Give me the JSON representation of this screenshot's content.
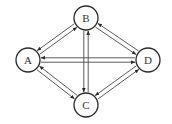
{
  "diagram": {
    "type": "directed-graph",
    "colors": {
      "background": "#ffffff",
      "stroke": "#2a2a2a",
      "edge": "#4a4a4a",
      "text": "#333333"
    },
    "nodes": [
      {
        "id": "A",
        "label": "A",
        "x": 28,
        "y": 60,
        "r": 12
      },
      {
        "id": "B",
        "label": "B",
        "x": 86,
        "y": 18,
        "r": 12
      },
      {
        "id": "C",
        "label": "C",
        "x": 86,
        "y": 105,
        "r": 12
      },
      {
        "id": "D",
        "label": "D",
        "x": 148,
        "y": 60,
        "r": 12
      }
    ],
    "edges": [
      {
        "from": "A",
        "to": "B"
      },
      {
        "from": "B",
        "to": "A"
      },
      {
        "from": "B",
        "to": "D"
      },
      {
        "from": "D",
        "to": "B"
      },
      {
        "from": "A",
        "to": "C"
      },
      {
        "from": "C",
        "to": "A"
      },
      {
        "from": "C",
        "to": "D"
      },
      {
        "from": "D",
        "to": "C"
      },
      {
        "from": "A",
        "to": "D"
      },
      {
        "from": "D",
        "to": "A"
      },
      {
        "from": "B",
        "to": "C"
      },
      {
        "from": "C",
        "to": "B"
      }
    ]
  }
}
